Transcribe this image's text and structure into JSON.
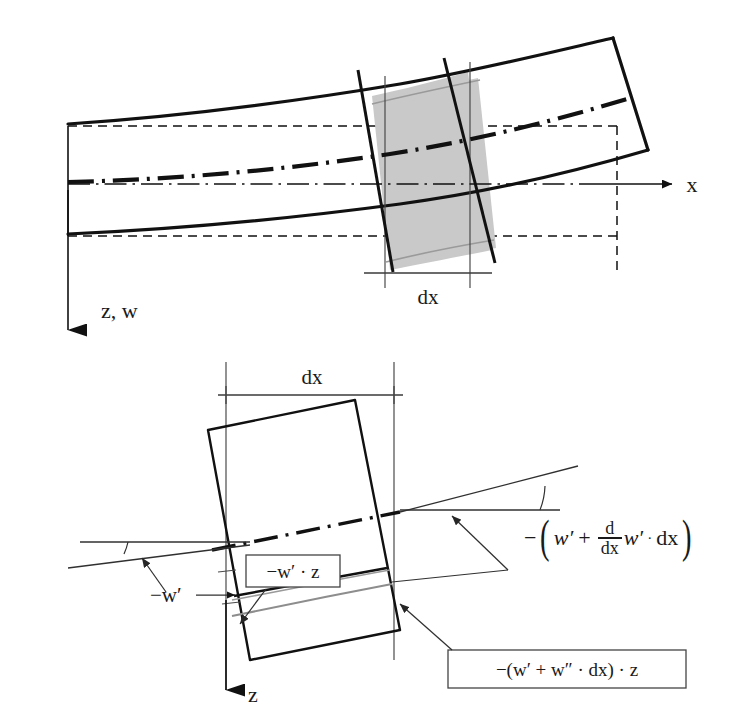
{
  "figure": {
    "background_color": "#ffffff",
    "line_color": "#111111",
    "shade_color": "#c9c9c9",
    "gray_curve_color": "#8d8d8d"
  },
  "upper_diagram": {
    "name": "deformed-beam-overview",
    "axis_x_label": "x",
    "axis_z_label": "z, w",
    "dx_label": "dx",
    "elements": {
      "beam_outline": "curved deformed beam with tilted right end face",
      "shaded_element": "differential slice dx shaded gray",
      "neutral_axis": "dash-dot centre line of deformed beam",
      "reference_undeformed": "dashed straight reference outline",
      "section_cuts": "two bold inclined cross-section lines bounding dx"
    }
  },
  "lower_diagram": {
    "name": "element-detail",
    "dx_label": "dx",
    "axis_z_label": "z",
    "slope_left_label": "−w′",
    "boxed_left_label": "−w′ · z",
    "boxed_right_label": "−(w′ + w″ · dx) · z",
    "slope_right_formula": {
      "lead_minus": "−",
      "open_paren": "(",
      "term1": "w′",
      "plus": "+",
      "frac_num": "d",
      "frac_den": "dx",
      "term2": "w′",
      "dot": "·",
      "term3": "dx",
      "close_paren": ")",
      "plain": "−(w′ + (d/dx) w′ · dx)"
    },
    "elements": {
      "rotated_element": "rotated rectangular element representing the slice",
      "neutral_axis": "dash-dot inclined centre line",
      "gray_band": "gray curved fibre line in lower part of element",
      "angle_arcs": "two small angle arcs marking the section rotations",
      "leader_arrows": "arrow leaders pointing from labels to geometry"
    }
  }
}
